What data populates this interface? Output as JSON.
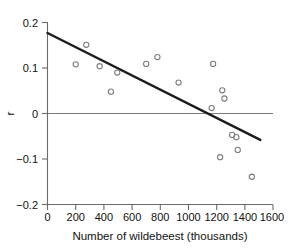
{
  "chart_data": {
    "type": "scatter",
    "title": "",
    "subtitle": "",
    "xlabel": "Number of wildebeest (thousands)",
    "ylabel": "r",
    "xlim": [
      0,
      1600
    ],
    "ylim": [
      -0.2,
      0.2
    ],
    "xticks": [
      0,
      200,
      400,
      600,
      800,
      1000,
      1200,
      1400,
      1600
    ],
    "xticklabels": [
      "0",
      "200",
      "400",
      "600",
      "800",
      "1000",
      "1200",
      "1400",
      "1600"
    ],
    "yticks": [
      -0.2,
      -0.1,
      0,
      0.1,
      0.2
    ],
    "yticklabels": [
      "−0.2",
      "−0.1",
      "0",
      "0.1",
      "0.2"
    ],
    "grid": false,
    "legend": null,
    "marker": "open-circle",
    "marker_color": "#7d7d7d",
    "line_color": "#1c1c1c",
    "zero_line_color": "#7a7a7a",
    "points": [
      {
        "x": 200,
        "y": 0.108
      },
      {
        "x": 275,
        "y": 0.151
      },
      {
        "x": 370,
        "y": 0.104
      },
      {
        "x": 450,
        "y": 0.048
      },
      {
        "x": 495,
        "y": 0.09
      },
      {
        "x": 700,
        "y": 0.109
      },
      {
        "x": 780,
        "y": 0.124
      },
      {
        "x": 930,
        "y": 0.068
      },
      {
        "x": 1165,
        "y": 0.012
      },
      {
        "x": 1175,
        "y": 0.109
      },
      {
        "x": 1240,
        "y": 0.051
      },
      {
        "x": 1255,
        "y": 0.033
      },
      {
        "x": 1225,
        "y": -0.096
      },
      {
        "x": 1310,
        "y": -0.047
      },
      {
        "x": 1340,
        "y": -0.052
      },
      {
        "x": 1350,
        "y": -0.08
      },
      {
        "x": 1450,
        "y": -0.139
      }
    ],
    "fit_line": {
      "x_start": 0,
      "y_start": 0.177,
      "x_end": 1510,
      "y_end": -0.058,
      "slope": -0.0001556,
      "intercept": 0.177
    },
    "reference_lines": [
      {
        "orientation": "horizontal",
        "y": 0,
        "x_start": 0,
        "x_end": 1600
      }
    ]
  }
}
